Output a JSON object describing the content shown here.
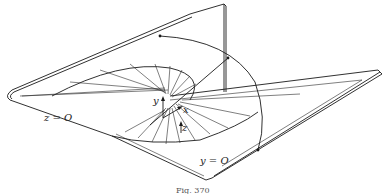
{
  "figure": {
    "caption": "Fig. 370",
    "labels": {
      "plane_z": "z = O",
      "plane_y": "y = O",
      "axis_x": "x",
      "axis_y": "y",
      "axis_z": "z"
    },
    "colors": {
      "ink": "#1a1a1a",
      "background": "#ffffff"
    }
  }
}
